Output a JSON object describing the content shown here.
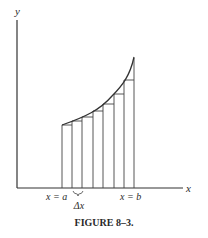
{
  "figure": {
    "caption": "FIGURE 8–3.",
    "axis_labels": {
      "x": "x",
      "y": "y"
    },
    "tick_labels": {
      "a": "x = a",
      "b": "x = b",
      "delta": "Δx"
    },
    "colors": {
      "stroke": "#333333",
      "background": "#ffffff"
    }
  },
  "diagram": {
    "type": "riemann-sum-rectangles",
    "curve": "increasing convex curve from x=a to x=b",
    "rectangles_count": 7
  }
}
